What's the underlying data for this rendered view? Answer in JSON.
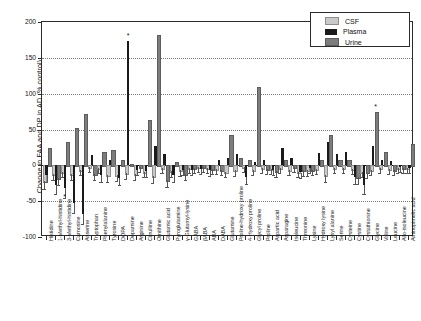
{
  "chart_data": {
    "type": "bar",
    "title": "",
    "xlabel": "",
    "ylabel": "Change in FAA and DP in  AD (% control)",
    "ylim": [
      -100,
      200
    ],
    "yticks": [
      200,
      150,
      100,
      50,
      0,
      -50,
      -100
    ],
    "grid": true,
    "legend_position": "top-right",
    "legend": [
      "CSF",
      "Plasma",
      "Urine"
    ],
    "colors": {
      "CSF": "#c9c9c9",
      "Plasma": "#1a1a1a",
      "Urine": "#7d7d7d"
    },
    "categories": [
      "Histidine",
      "1-Methyl-histidine",
      "3-Methyl-histidine",
      "Carnosine",
      "Anserine",
      "Tryptophan",
      "Phenylalanine",
      "Tyrosine",
      "DOPA",
      "Dopamine",
      "Arginine",
      "Citrulline",
      "Ornithine",
      "Glutamic acid",
      "Pyroglutamine",
      "γ-Glutamyl-lysine",
      "GABA",
      "βABA",
      "ABA",
      "DABA",
      "Glutamine",
      "Proline-hydroxy proline",
      "4-Hydroxy proline",
      "Glycyl proline",
      "Proline",
      "Aspartic acid",
      "Asparagine",
      "Isoleucine",
      "Threonine",
      "Lysine",
      "Hydroxy lysine",
      "Lysyl alanine",
      "Serine",
      "Cysteine",
      "Cystine",
      "Cystathionine",
      "Glycine",
      "Valine",
      "Leucine",
      "Allo-isoleucine",
      "Aminopimelic acid"
    ],
    "series": [
      {
        "name": "CSF",
        "values": [
          -22,
          -12,
          -9,
          -12,
          -6,
          -3,
          -4,
          -14,
          -13,
          -11,
          -12,
          -9,
          -15,
          -4,
          -8,
          -7,
          -4,
          -3,
          -4,
          -5,
          -9,
          -7,
          -3,
          -6,
          -4,
          -5,
          -4,
          -6,
          -9,
          -7,
          -5,
          -14,
          -4,
          -4,
          -5,
          -9,
          -6,
          -4,
          -5,
          -4,
          -4
        ]
      },
      {
        "name": "Plasma",
        "values": [
          -14,
          -28,
          -32,
          -52,
          -68,
          14,
          -14,
          8,
          -18,
          173,
          -6,
          -8,
          27,
          16,
          -14,
          -6,
          -6,
          -5,
          -7,
          8,
          10,
          16,
          -16,
          5,
          7,
          -6,
          24,
          10,
          -10,
          -4,
          17,
          32,
          16,
          18,
          -16,
          -28,
          27,
          8,
          6,
          -3,
          -4
        ]
      },
      {
        "name": "Urine",
        "values": [
          24,
          -18,
          32,
          52,
          71,
          -12,
          18,
          22,
          7,
          2,
          -3,
          63,
          182,
          -20,
          5,
          -12,
          -4,
          -3,
          -5,
          -6,
          43,
          10,
          8,
          110,
          -5,
          -8,
          8,
          -3,
          -7,
          -6,
          8,
          42,
          8,
          7,
          -16,
          -10,
          75,
          19,
          -6,
          -4,
          30
        ]
      }
    ],
    "significance_markers": [
      {
        "category": "Dopamine",
        "series": "Plasma",
        "value": 173,
        "symbol": "*"
      },
      {
        "category": "Glycine",
        "series": "Urine",
        "value": 75,
        "symbol": "*"
      },
      {
        "category": "3-Methyl-histidine",
        "series": "Plasma",
        "value": -32,
        "symbol": "*"
      }
    ]
  }
}
